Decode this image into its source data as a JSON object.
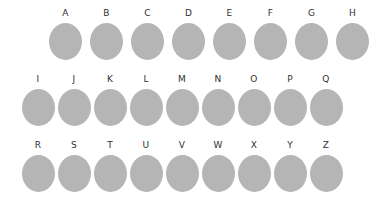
{
  "figure": {
    "background_color": "#ffffff",
    "shape_color": "#b5b5b5",
    "label_color": "#2f2f2f",
    "shape_kind": "ellipse-icon"
  },
  "chart_data": {
    "type": "table",
    "title": "",
    "xlabel": "",
    "ylabel": "",
    "grid": false,
    "legend": "none",
    "categories": [
      "A",
      "B",
      "C",
      "D",
      "E",
      "F",
      "G",
      "H",
      "I",
      "J",
      "K",
      "L",
      "M",
      "N",
      "O",
      "P",
      "Q",
      "R",
      "S",
      "T",
      "U",
      "V",
      "W",
      "X",
      "Y",
      "Z"
    ],
    "values": [
      1,
      1,
      1,
      1,
      1,
      1,
      1,
      1,
      1,
      1,
      1,
      1,
      1,
      1,
      1,
      1,
      1,
      1,
      1,
      1,
      1,
      1,
      1,
      1,
      1,
      1
    ]
  },
  "rows": [
    {
      "name": "row-1",
      "items": [
        {
          "label": "A"
        },
        {
          "label": "B"
        },
        {
          "label": "C"
        },
        {
          "label": "D"
        },
        {
          "label": "E"
        },
        {
          "label": "F"
        },
        {
          "label": "G"
        },
        {
          "label": "H"
        }
      ]
    },
    {
      "name": "row-2",
      "items": [
        {
          "label": "I"
        },
        {
          "label": "J"
        },
        {
          "label": "K"
        },
        {
          "label": "L"
        },
        {
          "label": "M"
        },
        {
          "label": "N"
        },
        {
          "label": "O"
        },
        {
          "label": "P"
        },
        {
          "label": "Q"
        }
      ]
    },
    {
      "name": "row-3",
      "items": [
        {
          "label": "R"
        },
        {
          "label": "S"
        },
        {
          "label": "T"
        },
        {
          "label": "U"
        },
        {
          "label": "V"
        },
        {
          "label": "W"
        },
        {
          "label": "X"
        },
        {
          "label": "Y"
        },
        {
          "label": "Z"
        }
      ]
    }
  ]
}
